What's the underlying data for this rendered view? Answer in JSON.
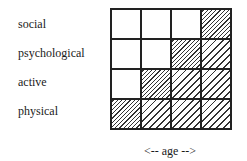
{
  "diagram": {
    "rows": [
      {
        "label": "social",
        "cells": [
          "empty",
          "empty",
          "empty",
          "dense"
        ]
      },
      {
        "label": "psychological",
        "cells": [
          "empty",
          "empty",
          "dense",
          "sparse"
        ]
      },
      {
        "label": "active",
        "cells": [
          "empty",
          "dense",
          "sparse",
          "sparse"
        ]
      },
      {
        "label": "physical",
        "cells": [
          "dense",
          "sparse",
          "sparse",
          "sparse"
        ]
      }
    ],
    "x_axis_label": "<-- age -->",
    "legend_semantics": {
      "empty": "no hatching",
      "dense": "dense diagonal hatching",
      "sparse": "sparse diagonal hatching"
    }
  }
}
